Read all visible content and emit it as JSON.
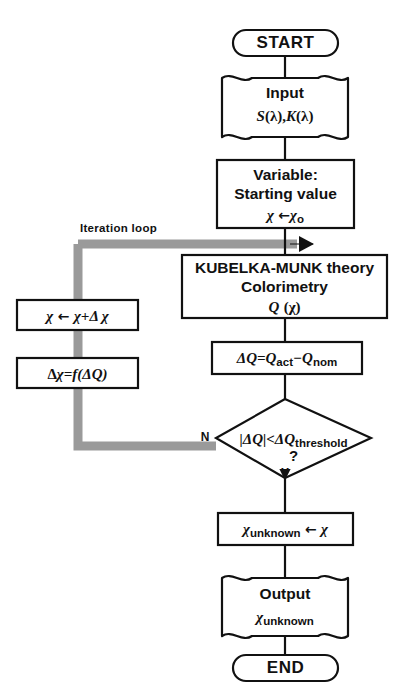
{
  "diagram": {
    "colors": {
      "stroke": "#111111",
      "background": "#ffffff",
      "loop_arrow": "#9a9a9a"
    },
    "nodes": {
      "start": {
        "shape": "terminal",
        "label": "START"
      },
      "input": {
        "shape": "document",
        "line1": "Input",
        "line2_s": "S",
        "line2_lambda1": "(λ),",
        "line2_k": "K",
        "line2_lambda2": "(λ)"
      },
      "variable": {
        "shape": "process",
        "line1": "Variable:",
        "line2": "Starting value",
        "line3_var": "χ",
        "line3_arrow": "←",
        "line3_val": "χ",
        "line3_sub": "o"
      },
      "kubelka": {
        "shape": "process",
        "line1": "KUBELKA-MUNK theory",
        "line2": "Colorimetry",
        "line3_q": "Q",
        "line3_arg": "(χ)"
      },
      "delta_q": {
        "shape": "process",
        "dq": "ΔQ=Q",
        "sub_act": "act",
        "minus": "−Q",
        "sub_nom": "nom"
      },
      "decision": {
        "shape": "diamond",
        "expr": "|ΔQ|<ΔQ",
        "sub": "threshold",
        "question": "?",
        "label_no": "N",
        "label_yes": "Y"
      },
      "assign_unknown": {
        "shape": "process",
        "var": "χ",
        "sub": "unknown",
        "arrow": "←",
        "val": "χ"
      },
      "output": {
        "shape": "document",
        "line1": "Output",
        "line2_var": "χ",
        "line2_sub": "unknown"
      },
      "end": {
        "shape": "terminal",
        "label": "END"
      },
      "update_chi": {
        "shape": "process",
        "lhs": "χ",
        "arrow": "←",
        "rhs": "χ+Δ χ"
      },
      "delta_chi": {
        "shape": "process",
        "expr_d": "Δ",
        "expr_chi": "χ",
        "expr_eq": "=f(ΔQ)"
      }
    },
    "annotations": {
      "iteration_loop": "Iteration loop"
    },
    "edges": [
      {
        "from": "start",
        "to": "input"
      },
      {
        "from": "input",
        "to": "variable"
      },
      {
        "from": "variable",
        "to": "kubelka"
      },
      {
        "from": "kubelka",
        "to": "delta_q"
      },
      {
        "from": "delta_q",
        "to": "decision"
      },
      {
        "from": "decision",
        "to": "assign_unknown",
        "label": "Y"
      },
      {
        "from": "decision",
        "to": "delta_chi",
        "label": "N"
      },
      {
        "from": "delta_chi",
        "to": "update_chi"
      },
      {
        "from": "update_chi",
        "to": "kubelka",
        "label": "Iteration loop"
      },
      {
        "from": "assign_unknown",
        "to": "output"
      },
      {
        "from": "output",
        "to": "end"
      }
    ]
  }
}
